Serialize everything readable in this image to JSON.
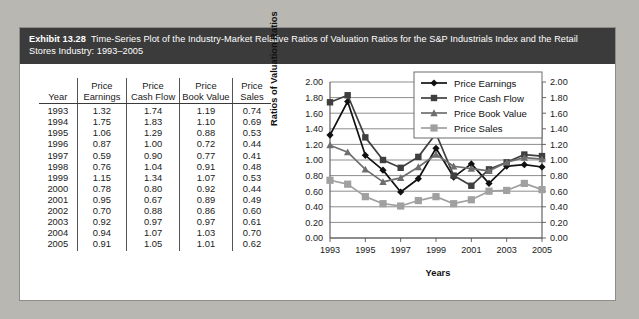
{
  "exhibit": {
    "number": "Exhibit 13.28",
    "caption": "Time-Series Plot of the Industry-Market Relative Ratios of Valuation Ratios for the S&P Industrials Index and the Retail Stores Industry: 1993–2005"
  },
  "table": {
    "headers_top": [
      "",
      "Price",
      "Price",
      "Price",
      "Price"
    ],
    "headers_bottom": [
      "Year",
      "Earnings",
      "Cash Flow",
      "Book Value",
      "Sales"
    ],
    "rows": [
      [
        "1993",
        "1.32",
        "1.74",
        "1.19",
        "0.74"
      ],
      [
        "1994",
        "1.75",
        "1.83",
        "1.10",
        "0.69"
      ],
      [
        "1995",
        "1.06",
        "1.29",
        "0.88",
        "0.53"
      ],
      [
        "1996",
        "0.87",
        "1.00",
        "0.72",
        "0.44"
      ],
      [
        "1997",
        "0.59",
        "0.90",
        "0.77",
        "0.41"
      ],
      [
        "1998",
        "0.76",
        "1.04",
        "0.91",
        "0.48"
      ],
      [
        "1999",
        "1.15",
        "1.34",
        "1.07",
        "0.53"
      ],
      [
        "2000",
        "0.78",
        "0.80",
        "0.92",
        "0.44"
      ],
      [
        "2001",
        "0.95",
        "0.67",
        "0.89",
        "0.49"
      ],
      [
        "2002",
        "0.70",
        "0.88",
        "0.86",
        "0.60"
      ],
      [
        "2003",
        "0.92",
        "0.97",
        "0.97",
        "0.61"
      ],
      [
        "2004",
        "0.94",
        "1.07",
        "1.03",
        "0.70"
      ],
      [
        "2005",
        "0.91",
        "1.05",
        "1.01",
        "0.62"
      ]
    ]
  },
  "chart_data": {
    "type": "line",
    "title": "",
    "xlabel": "Years",
    "ylabel": "Ratios of Valuation Ratios",
    "x": [
      1993,
      1994,
      1995,
      1996,
      1997,
      1998,
      1999,
      2000,
      2001,
      2002,
      2003,
      2004,
      2005
    ],
    "xtick_labels": [
      "1993",
      "1995",
      "1997",
      "1999",
      "2001",
      "2003",
      "2005"
    ],
    "xticks": [
      1993,
      1995,
      1997,
      1999,
      2001,
      2003,
      2005
    ],
    "xlim": [
      1993,
      2005
    ],
    "ylim": [
      0.0,
      2.0
    ],
    "yticks": [
      0.0,
      0.2,
      0.4,
      0.6,
      0.8,
      1.0,
      1.2,
      1.4,
      1.6,
      1.8,
      2.0
    ],
    "ytick_labels": [
      "0.00",
      "0.20",
      "0.40",
      "0.60",
      "0.80",
      "1.00",
      "1.20",
      "1.40",
      "1.60",
      "1.80",
      "2.00"
    ],
    "ytick_labels_right": [
      "0.00",
      "0.20",
      "0.40",
      "0.60",
      "0.80",
      "1.00",
      "1.20",
      "1.40",
      "1.60",
      "1.80",
      "2.00"
    ],
    "grid": "horizontal",
    "legend_position": "top-right",
    "series": [
      {
        "name": "Price Earnings",
        "marker": "diamond",
        "color": "#111111",
        "values": [
          1.32,
          1.75,
          1.06,
          0.87,
          0.59,
          0.76,
          1.15,
          0.78,
          0.95,
          0.7,
          0.92,
          0.94,
          0.91
        ]
      },
      {
        "name": "Price Cash Flow",
        "marker": "square",
        "color": "#3f3f3f",
        "values": [
          1.74,
          1.83,
          1.29,
          1.0,
          0.9,
          1.04,
          1.34,
          0.8,
          0.67,
          0.88,
          0.97,
          1.07,
          1.05
        ]
      },
      {
        "name": "Price Book Value",
        "marker": "triangle",
        "color": "#6e6e6e",
        "values": [
          1.19,
          1.1,
          0.88,
          0.72,
          0.77,
          0.91,
          1.07,
          0.92,
          0.89,
          0.86,
          0.97,
          1.03,
          1.01
        ]
      },
      {
        "name": "Price Sales",
        "marker": "square-light",
        "color": "#a0a0a0",
        "values": [
          0.74,
          0.69,
          0.53,
          0.44,
          0.41,
          0.48,
          0.53,
          0.44,
          0.49,
          0.6,
          0.61,
          0.7,
          0.62
        ]
      }
    ]
  },
  "colors": {
    "header_bg": "#3b3b3b",
    "panel_bg": "#ffffff",
    "page_bg": "#b9b7b2",
    "gridline": "#808080",
    "axis": "#555555"
  }
}
